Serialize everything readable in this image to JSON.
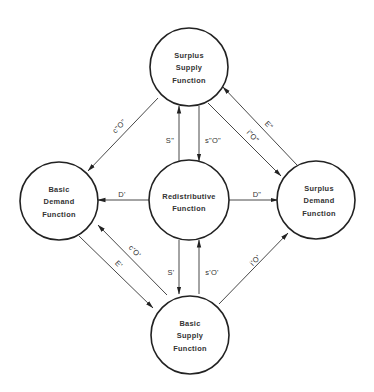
{
  "diagram": {
    "type": "flow-diagram",
    "nodes": [
      {
        "id": "surplus_supply",
        "lines": [
          "Surplus",
          "Supply",
          "Function"
        ],
        "cx": 189,
        "cy": 67,
        "r": 39
      },
      {
        "id": "basic_demand",
        "lines": [
          "Basic",
          "Demand",
          "Function"
        ],
        "cx": 59,
        "cy": 201,
        "r": 39
      },
      {
        "id": "redistributive",
        "lines": [
          "Redistributive",
          "Function"
        ],
        "cx": 189,
        "cy": 200,
        "r": 40
      },
      {
        "id": "surplus_demand",
        "lines": [
          "Surplus",
          "Demand",
          "Function"
        ],
        "cx": 316,
        "cy": 200,
        "r": 39
      },
      {
        "id": "basic_supply",
        "lines": [
          "Basic",
          "Supply",
          "Function"
        ],
        "cx": 190,
        "cy": 335,
        "r": 39
      }
    ],
    "edges": [
      {
        "label": "S\"",
        "from": "redistributive",
        "to": "surplus_supply"
      },
      {
        "label": "s\"O\"",
        "from": "surplus_supply",
        "to": "redistributive"
      },
      {
        "label": "S'",
        "from": "redistributive",
        "to": "basic_supply"
      },
      {
        "label": "s'O'",
        "from": "basic_supply",
        "to": "redistributive"
      },
      {
        "label": "D'",
        "from": "redistributive",
        "to": "basic_demand"
      },
      {
        "label": "D\"",
        "from": "redistributive",
        "to": "surplus_demand"
      },
      {
        "label": "c\"O\"",
        "from": "surplus_supply",
        "to": "basic_demand"
      },
      {
        "label": "E\"",
        "from": "surplus_demand",
        "to": "surplus_supply"
      },
      {
        "label": "i\"O\"",
        "from": "surplus_supply",
        "to": "surplus_demand"
      },
      {
        "label": "c'O'",
        "from": "basic_supply",
        "to": "basic_demand"
      },
      {
        "label": "E'",
        "from": "basic_demand",
        "to": "basic_supply"
      },
      {
        "label": "i'O'",
        "from": "basic_supply",
        "to": "surplus_demand"
      }
    ]
  },
  "colors": {
    "stroke": "#222222",
    "text": "#333333",
    "background": "#ffffff"
  }
}
